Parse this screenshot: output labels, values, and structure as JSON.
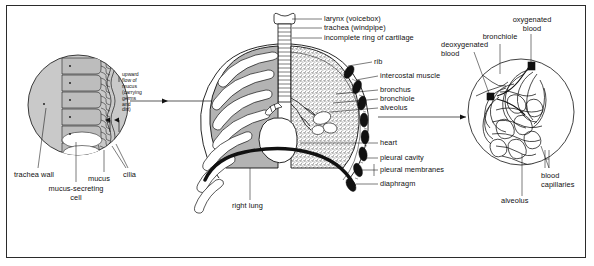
{
  "figure": {
    "width": 594,
    "height": 266,
    "background_color": "#ffffff",
    "border_color": "#2b2b2b",
    "ink_color": "#111111",
    "lung_fill_color": "#b3b3b3",
    "inset_fill_color": "#c9c9c9"
  },
  "left_inset": {
    "name": "trachea-wall-detail",
    "internal_note": "upward\nflow of\nmucus\n(carrying\ngerms\nand\ndirt)",
    "labels": {
      "trachea_wall": "trachea wall",
      "mucus_secreting_cell": "mucus-secreting\ncell",
      "mucus": "mucus",
      "cilia": "cilia"
    }
  },
  "center": {
    "name": "thorax-cross-section",
    "labels": {
      "larynx": "larynx (voicebox)",
      "trachea": "trachea (windpipe)",
      "cartilage_ring": "incomplete ring of cartilage",
      "rib": "rib",
      "intercostal_muscle": "intercostal muscle",
      "bronchus": "bronchus",
      "bronchiole": "bronchiole",
      "alveolus": "alveolus",
      "heart": "heart",
      "pleural_cavity": "pleural cavity",
      "pleural_membranes": "pleural membranes",
      "diaphragm": "diaphragm",
      "right_lung": "right lung"
    }
  },
  "right_inset": {
    "name": "alveolus-capillary-detail",
    "labels": {
      "oxygenated_blood": "oxygenated\nblood",
      "deoxygenated_blood": "deoxygenated\nblood",
      "bronchiole": "bronchiole",
      "blood_capillaries": "blood\ncapillaries",
      "alveolus": "alveolus"
    }
  }
}
